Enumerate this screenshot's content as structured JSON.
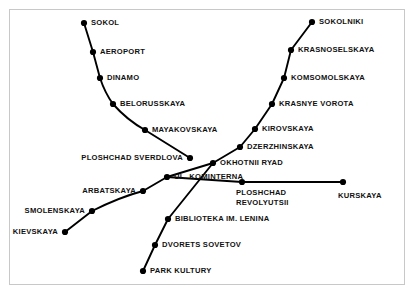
{
  "diagram": {
    "type": "transit-schematic-map",
    "background_color": "#ffffff",
    "frame_color": "#c8c8c8",
    "line_color": "#000000",
    "station_marker_color": "#000000",
    "label_color": "#111111",
    "stations": [
      {
        "id": "sokol",
        "label": "SOKOL",
        "x": 84,
        "y": 23,
        "label_x": 91,
        "label_y": 23,
        "anchor": "right"
      },
      {
        "id": "aeroport",
        "label": "AEROPORT",
        "x": 93,
        "y": 52,
        "label_x": 100,
        "label_y": 52,
        "anchor": "right"
      },
      {
        "id": "dinamo",
        "label": "DINAMO",
        "x": 100,
        "y": 78,
        "label_x": 107,
        "label_y": 78,
        "anchor": "right"
      },
      {
        "id": "belorusskaya",
        "label": "BELORUSSKAYA",
        "x": 113,
        "y": 104,
        "label_x": 120,
        "label_y": 104,
        "anchor": "right"
      },
      {
        "id": "mayakovskaya",
        "label": "MAYAKOVSKAYA",
        "x": 145,
        "y": 130,
        "label_x": 152,
        "label_y": 130,
        "anchor": "right"
      },
      {
        "id": "ploshchad-sverdlova",
        "label": "PLOSHCHAD SVERDLOVA",
        "x": 190,
        "y": 158,
        "label_x": 183,
        "label_y": 158,
        "anchor": "left"
      },
      {
        "id": "sokolniki",
        "label": "SOKOLNIKI",
        "x": 312,
        "y": 22,
        "label_x": 319,
        "label_y": 22,
        "anchor": "right"
      },
      {
        "id": "krasnoselskaya",
        "label": "KRASNOSELSKAYA",
        "x": 291,
        "y": 50,
        "label_x": 298,
        "label_y": 50,
        "anchor": "right"
      },
      {
        "id": "komsomolskaya",
        "label": "KOMSOMOLSKAYA",
        "x": 284,
        "y": 78,
        "label_x": 291,
        "label_y": 78,
        "anchor": "right"
      },
      {
        "id": "krasnye-vorota",
        "label": "KRASNYE VOROTA",
        "x": 272,
        "y": 104,
        "label_x": 279,
        "label_y": 104,
        "anchor": "right"
      },
      {
        "id": "kirovskaya",
        "label": "KIROVSKAYA",
        "x": 255,
        "y": 129,
        "label_x": 262,
        "label_y": 129,
        "anchor": "right"
      },
      {
        "id": "dzerzhinskaya",
        "label": "DZERZHINSKAYA",
        "x": 240,
        "y": 147,
        "label_x": 247,
        "label_y": 147,
        "anchor": "right"
      },
      {
        "id": "okhotnii-ryad",
        "label": "OKHOTNII RYAD",
        "x": 213,
        "y": 163,
        "label_x": 220,
        "label_y": 163,
        "anchor": "right"
      },
      {
        "id": "ul-kominterna",
        "label": "UL. KOMINTERNA",
        "x": 167,
        "y": 177,
        "label_x": 174,
        "label_y": 177,
        "anchor": "right"
      },
      {
        "id": "arbatskaya",
        "label": "ARBATSKAYA",
        "x": 143,
        "y": 191,
        "label_x": 136,
        "label_y": 191,
        "anchor": "left"
      },
      {
        "id": "smolenskaya",
        "label": "SMOLENSKAYA",
        "x": 92,
        "y": 211,
        "label_x": 85,
        "label_y": 211,
        "anchor": "left"
      },
      {
        "id": "kievskaya",
        "label": "KIEVSKAYA",
        "x": 65,
        "y": 232,
        "label_x": 58,
        "label_y": 232,
        "anchor": "left"
      },
      {
        "id": "ploshchad-revolyutsii",
        "label": "PLOSHCHAD\nREVOLYUTSII",
        "x": 242,
        "y": 182,
        "label_x": 236,
        "label_y": 188,
        "anchor": "below"
      },
      {
        "id": "kurskaya",
        "label": "KURSKAYA",
        "x": 343,
        "y": 182,
        "label_x": 338,
        "label_y": 191,
        "anchor": "below"
      },
      {
        "id": "biblioteka-im-lenina",
        "label": "BIBLIOTEKA IM. LENINA",
        "x": 168,
        "y": 219,
        "label_x": 175,
        "label_y": 219,
        "anchor": "right"
      },
      {
        "id": "dvorets-sovetov",
        "label": "DVORETS SOVETOV",
        "x": 155,
        "y": 245,
        "label_x": 162,
        "label_y": 245,
        "anchor": "right"
      },
      {
        "id": "park-kultury",
        "label": "PARK KULTURY",
        "x": 143,
        "y": 271,
        "label_x": 150,
        "label_y": 271,
        "anchor": "right"
      }
    ],
    "lines": [
      {
        "id": "northwest-branch",
        "path": "M 84,23 L 93,52 L 100,78 Q 105,93 113,104 Q 127,120 145,130 L 190,158"
      },
      {
        "id": "northeast-branch",
        "path": "M 312,22 L 291,50 L 284,78 L 272,104 L 255,129 L 240,147 L 213,163 L 167,177"
      },
      {
        "id": "revolyutsii-kurskaya-branch",
        "path": "M 167,177 L 242,182 L 343,182"
      },
      {
        "id": "southwest-branch",
        "path": "M 65,232 L 92,211 Q 120,197 143,191 L 167,177"
      },
      {
        "id": "south-branch",
        "path": "M 143,271 L 155,245 L 168,219 L 213,163"
      }
    ]
  }
}
